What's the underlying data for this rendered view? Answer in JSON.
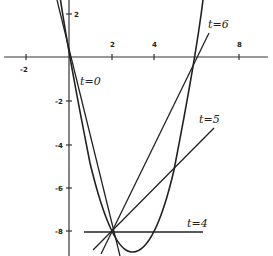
{
  "diagram": {
    "curve": "y = x^2 - 6x",
    "fixed_point": {
      "x": 2,
      "y": -8
    },
    "x_axis_ticks": [
      "-2",
      "2",
      "4",
      "8"
    ],
    "y_axis_ticks": [
      "2",
      "-2",
      "-4",
      "-6",
      "-8"
    ],
    "lines": [
      {
        "label": "t=0",
        "through": [
          0,
          0
        ]
      },
      {
        "label": "t=4",
        "through": [
          4,
          -8
        ]
      },
      {
        "label": "t=5",
        "through": [
          5,
          -5
        ]
      },
      {
        "label": "t=6",
        "through": [
          6,
          0
        ]
      }
    ],
    "colors": {
      "ink": "#222222",
      "background": "#ffffff"
    }
  }
}
